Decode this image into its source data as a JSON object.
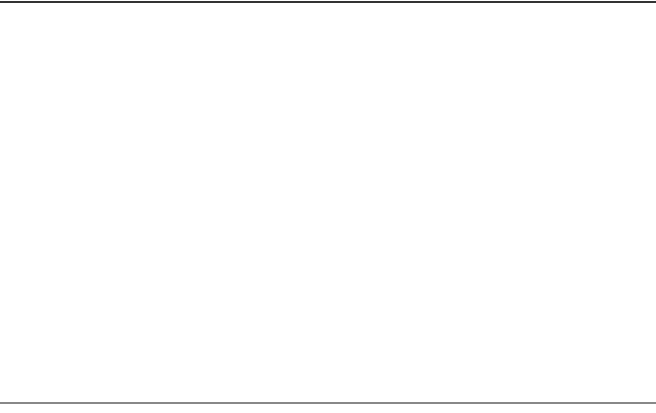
{
  "chart_data": [
    {
      "type": "bar",
      "orientation": "horizontal-population-pyramid",
      "panel": "(a)",
      "title": "expansive (Mexico)",
      "title_lines": [
        "(a)",
        "expansive",
        "(Mexico)"
      ],
      "xlabel": "percent of population",
      "ylabel": "age",
      "xticks": [
        8,
        6,
        4,
        2,
        0,
        2,
        4,
        6,
        8
      ],
      "xlim": [
        -9,
        9
      ],
      "categories": [
        "85 +",
        "80–84",
        "75–79",
        "70–74",
        "65–69",
        "60–64",
        "55–59",
        "50–54",
        "45–49",
        "40–44",
        "35–39",
        "30–34",
        "25–29",
        "20–24",
        "15–19",
        "10–14",
        "5–9",
        "Under 5"
      ],
      "series": [
        {
          "name": "male",
          "color": "#3a3a3a",
          "values": [
            0.2,
            0.3,
            0.4,
            0.5,
            0.6,
            0.8,
            0.9,
            1.2,
            1.5,
            1.8,
            2.2,
            2.6,
            3.2,
            3.8,
            5.0,
            6.3,
            7.5,
            8.7
          ]
        },
        {
          "name": "female",
          "color": "#8e8e8e",
          "values": [
            0.3,
            0.4,
            0.5,
            0.7,
            0.8,
            1.0,
            1.1,
            1.4,
            1.7,
            2.0,
            2.5,
            2.9,
            3.4,
            4.4,
            5.2,
            6.2,
            7.3,
            8.5
          ]
        }
      ]
    },
    {
      "type": "bar",
      "orientation": "horizontal-population-pyramid",
      "panel": "(b)",
      "title": "constrictive (Canada)",
      "title_lines": [
        "(b)",
        "constrictive",
        "(Canada)"
      ],
      "xlabel": "percent of population",
      "ylabel": "age",
      "xticks": [
        6,
        4,
        2,
        0,
        2,
        4,
        6
      ],
      "xlim": [
        -6,
        6
      ],
      "categories": [
        "85 +",
        "80–84",
        "75–79",
        "70–74",
        "65–69",
        "60–64",
        "55–59",
        "50–54",
        "45–49",
        "40–44",
        "35–39",
        "30–34",
        "25–29",
        "20–24",
        "15–19",
        "10–14",
        "5–9",
        "Under 5"
      ],
      "series": [
        {
          "name": "male",
          "color": "#3a3a3a",
          "values": [
            0.3,
            0.6,
            1.0,
            1.6,
            2.3,
            2.7,
            3.3,
            3.5,
            3.3,
            3.2,
            3.2,
            3.5,
            4.2,
            4.8,
            5.0,
            5.3,
            4.8,
            4.1
          ]
        },
        {
          "name": "female",
          "color": "#8e8e8e",
          "values": [
            0.7,
            1.0,
            1.3,
            1.8,
            2.5,
            2.8,
            3.1,
            3.3,
            3.2,
            3.0,
            3.2,
            3.9,
            4.7,
            5.1,
            5.6,
            5.0,
            4.4,
            4.0
          ]
        }
      ]
    },
    {
      "type": "bar",
      "orientation": "horizontal-population-pyramid",
      "panel": "(c)",
      "title": "near stationary (Sweden)",
      "title_lines": [
        "(c)",
        "near",
        "stationary",
        "(Sweden)"
      ],
      "xlabel": "percent of population",
      "ylabel": "age",
      "xticks": [
        6,
        4,
        2,
        0,
        2,
        4,
        6
      ],
      "xlim": [
        -6,
        6
      ],
      "categories": [
        "85 +",
        "80–84",
        "75–79",
        "70–74",
        "65–69",
        "60–64",
        "55–59",
        "50–54",
        "45–49",
        "40–44",
        "35–39",
        "30–34",
        "25–29",
        "20–24",
        "15–19",
        "10–14",
        "5–9",
        "Under 5"
      ],
      "series": [
        {
          "name": "male",
          "color": "#3a3a3a",
          "values": [
            0.5,
            0.8,
            1.3,
            2.1,
            2.9,
            3.3,
            3.5,
            3.5,
            3.3,
            3.1,
            3.3,
            4.1,
            4.5,
            3.9,
            3.6,
            4.1,
            4.1,
            3.9
          ]
        },
        {
          "name": "female",
          "color": "#8e8e8e",
          "values": [
            0.6,
            1.2,
            1.9,
            2.5,
            3.2,
            3.5,
            3.6,
            3.6,
            2.9,
            2.7,
            3.3,
            4.3,
            4.4,
            3.9,
            3.6,
            4.1,
            4.1,
            3.5
          ]
        }
      ]
    }
  ],
  "labels": {
    "age": "age",
    "male": "male",
    "female": "female",
    "xlabel": "percent of population"
  }
}
